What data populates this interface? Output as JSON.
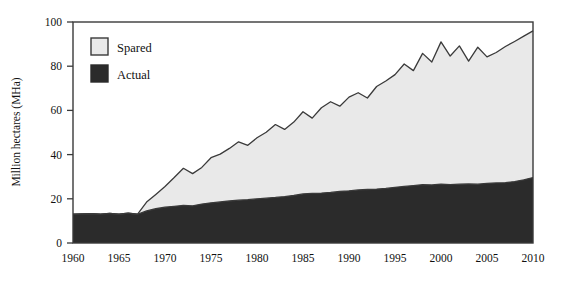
{
  "chart_data": {
    "type": "area",
    "title": "",
    "subtitle": "",
    "xlabel": "",
    "ylabel": "Million hectares (MHa)",
    "xlim": [
      1960,
      2010
    ],
    "ylim": [
      0,
      100
    ],
    "grid": false,
    "stacked": true,
    "legend_position": "top-left",
    "x_tick_labels": [
      "1960",
      "1965",
      "1970",
      "1975",
      "1980",
      "1985",
      "1990",
      "1995",
      "2000",
      "2005",
      "2010"
    ],
    "x_ticks": [
      1960,
      1965,
      1970,
      1975,
      1980,
      1985,
      1990,
      1995,
      2000,
      2005,
      2010
    ],
    "y_tick_labels": [
      "0",
      "20",
      "40",
      "60",
      "80",
      "100"
    ],
    "y_ticks": [
      0,
      20,
      40,
      60,
      80,
      100
    ],
    "x": [
      1960,
      1961,
      1962,
      1963,
      1964,
      1965,
      1966,
      1967,
      1968,
      1969,
      1970,
      1971,
      1972,
      1973,
      1974,
      1975,
      1976,
      1977,
      1978,
      1979,
      1980,
      1981,
      1982,
      1983,
      1984,
      1985,
      1986,
      1987,
      1988,
      1989,
      1990,
      1991,
      1992,
      1993,
      1994,
      1995,
      1996,
      1997,
      1998,
      1999,
      2000,
      2001,
      2002,
      2003,
      2004,
      2005,
      2006,
      2007,
      2008,
      2009,
      2010
    ],
    "series": [
      {
        "name": "Actual",
        "color": "#2b2b2b",
        "values": [
          13.0,
          13.2,
          13.3,
          13.1,
          13.4,
          13.0,
          13.5,
          13.0,
          14.5,
          15.5,
          16.2,
          16.6,
          17.0,
          16.8,
          17.6,
          18.2,
          18.6,
          19.0,
          19.4,
          19.6,
          20.0,
          20.3,
          20.6,
          21.0,
          21.5,
          22.2,
          22.5,
          22.6,
          22.9,
          23.3,
          23.6,
          24.0,
          24.2,
          24.4,
          24.7,
          25.2,
          25.6,
          26.0,
          26.4,
          26.3,
          26.6,
          26.4,
          26.6,
          26.7,
          26.6,
          27.0,
          27.2,
          27.3,
          27.8,
          28.6,
          29.6
        ]
      },
      {
        "name": "Spared",
        "color": "#e9e9e9",
        "values": [
          0.0,
          0.0,
          0.0,
          0.0,
          0.0,
          0.0,
          0.0,
          0.0,
          4.0,
          6.5,
          9.4,
          13.0,
          16.8,
          14.6,
          16.6,
          20.4,
          21.6,
          23.8,
          26.4,
          24.6,
          27.6,
          29.8,
          33.0,
          30.4,
          33.2,
          37.2,
          34.0,
          38.6,
          41.0,
          38.6,
          42.4,
          44.0,
          41.4,
          46.4,
          48.6,
          51.0,
          55.4,
          52.0,
          59.4,
          55.6,
          64.4,
          58.2,
          62.6,
          55.6,
          62.0,
          57.2,
          59.0,
          61.6,
          63.4,
          65.0,
          66.4
        ]
      }
    ],
    "totals_note": "Upper boundary = Actual + Spared (stacked total)",
    "legend": [
      {
        "label": "Spared",
        "swatch_color": "#e9e9e9",
        "swatch_border": "#3a3a3a"
      },
      {
        "label": "Actual",
        "swatch_color": "#2b2b2b",
        "swatch_border": "#2b2b2b"
      }
    ]
  }
}
